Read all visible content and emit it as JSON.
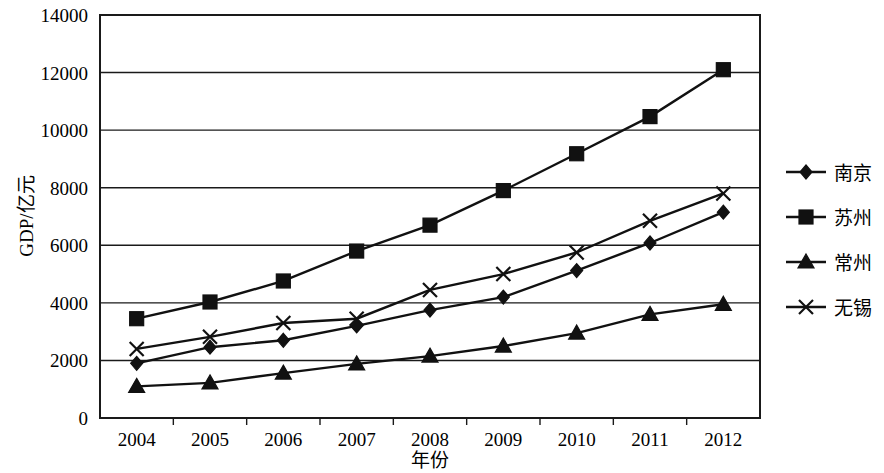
{
  "chart_data": {
    "type": "line",
    "title": "",
    "xlabel": "年份",
    "ylabel": "GDP/亿元",
    "categories": [
      "2004",
      "2005",
      "2006",
      "2007",
      "2008",
      "2009",
      "2010",
      "2011",
      "2012"
    ],
    "x": [
      2004,
      2005,
      2006,
      2007,
      2008,
      2009,
      2010,
      2011,
      2012
    ],
    "ylim": [
      0,
      14000
    ],
    "ytick_labels": [
      "0",
      "2000",
      "4000",
      "6000",
      "8000",
      "10000",
      "12000",
      "14000"
    ],
    "yticks": [
      0,
      2000,
      4000,
      6000,
      8000,
      10000,
      12000,
      14000
    ],
    "grid": "horizontal",
    "legend_position": "right",
    "series": [
      {
        "name": "南京",
        "marker": "diamond",
        "color": "#111111",
        "values": [
          1900,
          2460,
          2700,
          3200,
          3750,
          4200,
          5120,
          6080,
          7150
        ]
      },
      {
        "name": "苏州",
        "marker": "square",
        "color": "#111111",
        "values": [
          3450,
          4030,
          4760,
          5800,
          6700,
          7900,
          9180,
          10470,
          12100
        ]
      },
      {
        "name": "常州",
        "marker": "triangle",
        "color": "#111111",
        "values": [
          1100,
          1220,
          1560,
          1880,
          2150,
          2500,
          2950,
          3600,
          3950
        ]
      },
      {
        "name": "无锡",
        "marker": "x",
        "color": "#111111",
        "values": [
          2400,
          2820,
          3300,
          3450,
          4450,
          5000,
          5750,
          6850,
          7800
        ]
      }
    ]
  },
  "axes": {
    "y_axis_title": "GDP/亿元",
    "x_axis_title": "年份"
  },
  "legend": {
    "entries": [
      {
        "label": "南京",
        "marker": "diamond"
      },
      {
        "label": "苏州",
        "marker": "square"
      },
      {
        "label": "常州",
        "marker": "triangle"
      },
      {
        "label": "无锡",
        "marker": "x"
      }
    ]
  }
}
